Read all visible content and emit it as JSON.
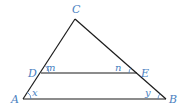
{
  "diagram": {
    "type": "geometry",
    "colors": {
      "line": "#1a1a1a",
      "label": "#4a7fc1",
      "background": "#ffffff"
    },
    "points": {
      "C": {
        "label": "C",
        "x": 75,
        "y": 19,
        "lx": 72,
        "ly": 13
      },
      "A": {
        "label": "A",
        "x": 23,
        "y": 99,
        "lx": 11,
        "ly": 103
      },
      "B": {
        "label": "B",
        "x": 166,
        "y": 99,
        "lx": 169,
        "ly": 103
      },
      "D": {
        "label": "D",
        "x": 41,
        "y": 73,
        "lx": 28,
        "ly": 77
      },
      "E": {
        "label": "E",
        "x": 137,
        "y": 73,
        "lx": 141,
        "ly": 77
      }
    },
    "segments": [
      {
        "name": "AC",
        "from": "A",
        "to": "C"
      },
      {
        "name": "CB",
        "from": "C",
        "to": "B"
      },
      {
        "name": "AB",
        "from": "A",
        "to": "B"
      },
      {
        "name": "DE",
        "from": "D",
        "to": "E"
      }
    ],
    "angles": {
      "m": {
        "label": "m",
        "at": "D",
        "lx": 46,
        "ly": 71
      },
      "n": {
        "label": "n",
        "at": "E",
        "lx": 115,
        "ly": 71
      },
      "x": {
        "label": "x",
        "at": "A",
        "lx": 32,
        "ly": 96
      },
      "y": {
        "label": "y",
        "at": "B",
        "lx": 145,
        "ly": 96
      }
    }
  }
}
